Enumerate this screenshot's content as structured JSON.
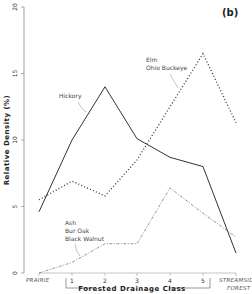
{
  "chart_data": {
    "type": "line",
    "panel_label": "(b)",
    "title": "",
    "xlabel": "Forested Drainage Class",
    "ylabel": "Relative Density (%)",
    "ylim": [
      0,
      20
    ],
    "yticks": [
      "0",
      "5",
      "10",
      "15",
      "20"
    ],
    "categories": [
      "PRAIRIE",
      "1",
      "2",
      "3",
      "4",
      "5",
      "STREAMSIDE FOREST"
    ],
    "grid": false,
    "series": [
      {
        "name": "Hickory",
        "style": "solid",
        "values": [
          4.6,
          10.0,
          14.0,
          10.1,
          8.7,
          8.0,
          1.5
        ]
      },
      {
        "name": "Elm, Ohio Buckeye",
        "style": "dotted",
        "values": [
          5.5,
          6.9,
          5.8,
          8.5,
          12.5,
          16.5,
          11.3
        ]
      },
      {
        "name": "Ash, Bur Oak, Black Walnut",
        "style": "dash-dot",
        "values": [
          0.0,
          0.8,
          2.2,
          2.2,
          6.4,
          4.5,
          2.7
        ]
      }
    ],
    "annotations": [
      {
        "text": "Hickory"
      },
      {
        "text": "Elm"
      },
      {
        "text": "Ohio Buckeye"
      },
      {
        "text": "Ash"
      },
      {
        "text": "Bur Oak"
      },
      {
        "text": "Black Walnut"
      }
    ],
    "cat_labels": {
      "prairie": "PRAIRIE",
      "streamside_1": "STREAMSIDE",
      "streamside_2": "FOREST"
    }
  }
}
